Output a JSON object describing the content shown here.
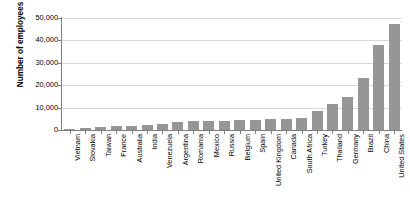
{
  "chart_data": {
    "type": "bar",
    "title": "",
    "xlabel": "",
    "ylabel": "Number of employees",
    "ylim": [
      0,
      50000
    ],
    "ytick_labels": [
      "50,000",
      "40,000",
      "30,000",
      "20,000",
      "10,000",
      "0"
    ],
    "ytick_values": [
      50000,
      40000,
      30000,
      20000,
      10000,
      0
    ],
    "grid": true,
    "legend": "none",
    "bar_color": "#969696",
    "categories": [
      "Vietnam",
      "Slovakia",
      "Taiwan",
      "France",
      "Australia",
      "India",
      "Venezuela",
      "Argentina",
      "Romania",
      "Mexico",
      "Russia",
      "Belgium",
      "Spain",
      "United Kingdom",
      "Canada",
      "South Africa",
      "Turkey",
      "Thailand",
      "Germany",
      "Brazil",
      "China",
      "United States"
    ],
    "values": [
      400,
      700,
      1300,
      1800,
      1900,
      2100,
      2500,
      3700,
      4100,
      4200,
      4200,
      4400,
      4600,
      5000,
      5100,
      5400,
      8600,
      11700,
      14800,
      23300,
      38000,
      47500
    ]
  }
}
